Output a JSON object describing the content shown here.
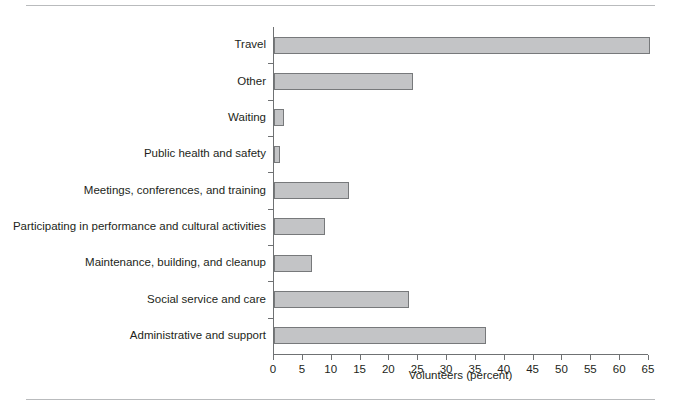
{
  "chart_data": {
    "type": "bar",
    "orientation": "horizontal",
    "title": "",
    "xlabel": "Volunteers (percent)",
    "ylabel": "",
    "xlim": [
      0,
      65
    ],
    "xticks": [
      0,
      5,
      10,
      15,
      20,
      25,
      30,
      35,
      40,
      45,
      50,
      55,
      60,
      65
    ],
    "grid": false,
    "legend": null,
    "categories": [
      "Travel",
      "Other",
      "Waiting",
      "Public health and safety",
      "Meetings, conferences, and training",
      "Participating in performance and cultural activities",
      "Maintenance, building, and cleanup",
      "Social service and care",
      "Administrative and support"
    ],
    "values": [
      65.2,
      24.1,
      1.8,
      1.1,
      13.0,
      8.9,
      6.6,
      23.4,
      36.8
    ],
    "bar_fill": "#c3c4c6",
    "bar_edge": "#77797b",
    "axis_color": "#6f7173",
    "rule_color": "#b9bbbd",
    "text_color": "#231f20"
  },
  "axis": {
    "x_title": "Volunteers (percent)",
    "tick_labels": [
      "0",
      "5",
      "10",
      "15",
      "20",
      "25",
      "30",
      "35",
      "40",
      "45",
      "50",
      "55",
      "60",
      "65"
    ]
  },
  "categories": {
    "c0": "Travel",
    "c1": "Other",
    "c2": "Waiting",
    "c3": "Public health and safety",
    "c4": "Meetings, conferences, and training",
    "c5": "Participating in performance and cultural activities",
    "c6": "Maintenance, building, and cleanup",
    "c7": "Social service and care",
    "c8": "Administrative and support"
  }
}
